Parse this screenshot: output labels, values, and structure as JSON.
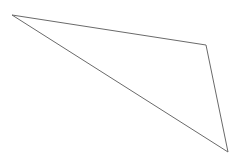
{
  "canvas": {
    "width": 239,
    "height": 165,
    "background_color": "#ffffff",
    "title": "Polygon Line Drawing"
  },
  "figure": {
    "name": "quadrilateral-outline",
    "shape_type": "closed-polygon",
    "stroke_color": "#6a6a6a",
    "stroke_width": 1,
    "fill": "none",
    "vertex_count": 3,
    "vertices": [
      {
        "label": "top-left-apex",
        "x": 12,
        "y": 15
      },
      {
        "label": "top-right-bend",
        "x": 206,
        "y": 45
      },
      {
        "label": "bottom-right-point",
        "x": 228,
        "y": 152
      }
    ],
    "points_attribute": "12,15 206,45 228,152",
    "edges": [
      {
        "label": "top-edge",
        "from": "top-left-apex",
        "to": "top-right-bend"
      },
      {
        "label": "right-edge",
        "from": "top-right-bend",
        "to": "bottom-right-point"
      },
      {
        "label": "diagonal-edge",
        "from": "bottom-right-point",
        "to": "top-left-apex"
      }
    ]
  }
}
